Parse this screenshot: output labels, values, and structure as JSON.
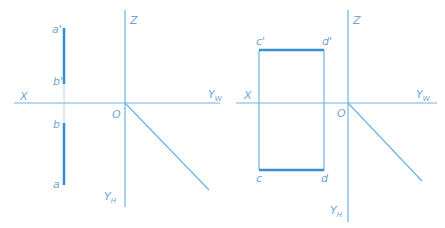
{
  "colors": {
    "axis": "#6cb4e4",
    "thick": "#3a8fcf",
    "label": "#6fa8cf"
  },
  "left": {
    "axis_x": "X",
    "axis_z": "Z",
    "axis_yw": "Y",
    "axis_yw_sub": "W",
    "axis_yh": "Y",
    "axis_yh_sub": "H",
    "origin": "O",
    "points": {
      "a_prime": "a'",
      "b_prime": "b'",
      "b": "b",
      "a": "a"
    }
  },
  "right": {
    "axis_x": "X",
    "axis_z": "Z",
    "axis_yw": "Y",
    "axis_yw_sub": "W",
    "axis_yh": "Y",
    "axis_yh_sub": "H",
    "origin": "O",
    "points": {
      "c_prime": "c'",
      "d_prime": "d'",
      "c": "c",
      "d": "d"
    }
  }
}
